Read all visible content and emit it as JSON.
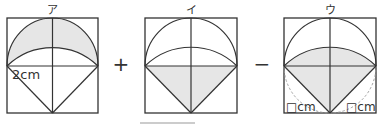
{
  "figures": [
    {
      "id": "a",
      "label": "ア",
      "annotation": "2cm",
      "shaded": "upper-lens-region"
    },
    {
      "id": "i",
      "label": "イ",
      "annotation": "",
      "shaded": "lower-triangle"
    },
    {
      "id": "u",
      "label": "ウ",
      "annotation_left": "□cm",
      "annotation_right": "□cm",
      "shaded": "upper-lens-plus-triangle"
    }
  ],
  "operators": {
    "plus": "+",
    "minus": "−"
  },
  "colors": {
    "stroke": "#333333",
    "shade": "#e6e6e6",
    "dashed": "#999999",
    "underline": "#bbbbbb"
  }
}
